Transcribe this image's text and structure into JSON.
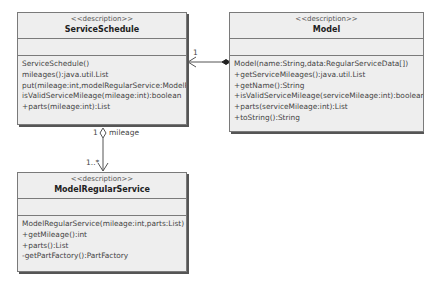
{
  "classes": {
    "service_schedule": {
      "stereotype": "<<description>>",
      "name": "ServiceSchedule",
      "operations": [
        "ServiceSchedule()",
        "mileages():java.util.List",
        "put(mileage:int,modelRegularService:ModelRegularService)",
        "isValidServiceMileage(mileage:int):boolean",
        "+parts(mileage:int):List"
      ]
    },
    "model": {
      "stereotype": "<<description>>",
      "name": "Model",
      "operations": [
        "Model(name:String,data:RegularServiceData[])",
        "+getServiceMileages():java.util.List",
        "+getName():String",
        "+isValidServiceMileage(serviceMileage:int):boolean",
        "+parts(serviceMileage:int):List",
        "+toString():String"
      ]
    },
    "model_regular_service": {
      "stereotype": "<<description>>",
      "name": "ModelRegularService",
      "operations": [
        "ModelRegularService(mileage:int,parts:List)",
        "+getMileage():int",
        "+parts():List",
        "-getPartFactory():PartFactory"
      ]
    }
  },
  "links": {
    "model_to_schedule": {
      "multiplicity": "1"
    },
    "schedule_to_regular": {
      "source_multiplicity": "1",
      "role": "mileage",
      "target_multiplicity": "1..*"
    }
  }
}
